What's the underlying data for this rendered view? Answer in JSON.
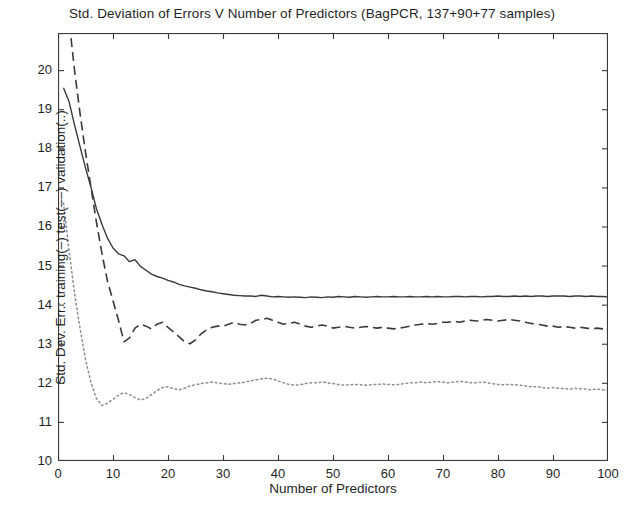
{
  "chart_data": {
    "type": "line",
    "title": "Std. Deviation of Errors V Number of Predictors (BagPCR, 137+90+77 samples)",
    "xlabel": "Number of Predictors",
    "ylabel": "Std. Dev. Err.: training(–) test(––) validation(..)",
    "xlim": [
      0,
      100
    ],
    "ylim": [
      10,
      20.95
    ],
    "xticks": [
      0,
      10,
      20,
      30,
      40,
      50,
      60,
      70,
      80,
      90,
      100
    ],
    "yticks": [
      10,
      11,
      12,
      13,
      14,
      15,
      16,
      17,
      18,
      19,
      20
    ],
    "xtick_labels": [
      "0",
      "10",
      "20",
      "30",
      "40",
      "50",
      "60",
      "70",
      "80",
      "90",
      "100"
    ],
    "ytick_labels": [
      "10",
      "11",
      "12",
      "13",
      "14",
      "15",
      "16",
      "17",
      "18",
      "19",
      "20"
    ],
    "grid": false,
    "legend": "none",
    "box": true,
    "tick_direction": "in",
    "axis_color": "#3a3a3a",
    "x": [
      1,
      2,
      3,
      4,
      5,
      6,
      7,
      8,
      9,
      10,
      11,
      12,
      13,
      14,
      15,
      16,
      17,
      18,
      19,
      20,
      21,
      22,
      23,
      24,
      25,
      26,
      27,
      28,
      29,
      30,
      31,
      32,
      33,
      34,
      35,
      36,
      37,
      38,
      39,
      40,
      41,
      42,
      43,
      44,
      45,
      46,
      47,
      48,
      49,
      50,
      51,
      52,
      53,
      54,
      55,
      56,
      57,
      58,
      59,
      60,
      61,
      62,
      63,
      64,
      65,
      66,
      67,
      68,
      69,
      70,
      71,
      72,
      73,
      74,
      75,
      76,
      77,
      78,
      79,
      80,
      81,
      82,
      83,
      84,
      85,
      86,
      87,
      88,
      89,
      90,
      91,
      92,
      93,
      94,
      95,
      96,
      97,
      98,
      99,
      100
    ],
    "series": [
      {
        "name": "training",
        "style": "solid",
        "color": "#3a3a3a",
        "width": 1.4,
        "values": [
          19.55,
          19.2,
          18.6,
          18.05,
          17.5,
          17.0,
          16.45,
          16.05,
          15.7,
          15.45,
          15.3,
          15.25,
          15.1,
          15.15,
          14.98,
          14.88,
          14.78,
          14.72,
          14.68,
          14.62,
          14.58,
          14.52,
          14.48,
          14.45,
          14.42,
          14.38,
          14.35,
          14.33,
          14.3,
          14.28,
          14.26,
          14.24,
          14.23,
          14.22,
          14.22,
          14.21,
          14.24,
          14.22,
          14.2,
          14.21,
          14.2,
          14.19,
          14.2,
          14.19,
          14.18,
          14.2,
          14.19,
          14.18,
          14.2,
          14.19,
          14.21,
          14.2,
          14.19,
          14.21,
          14.2,
          14.19,
          14.2,
          14.21,
          14.2,
          14.2,
          14.21,
          14.2,
          14.2,
          14.21,
          14.2,
          14.2,
          14.21,
          14.2,
          14.21,
          14.2,
          14.2,
          14.21,
          14.21,
          14.2,
          14.21,
          14.21,
          14.2,
          14.21,
          14.21,
          14.22,
          14.21,
          14.21,
          14.22,
          14.21,
          14.22,
          14.21,
          14.22,
          14.22,
          14.21,
          14.22,
          14.22,
          14.22,
          14.21,
          14.22,
          14.22,
          14.21,
          14.22,
          14.21,
          14.21,
          14.2
        ]
      },
      {
        "name": "test",
        "style": "dashed",
        "color": "#3a3a3a",
        "width": 1.6,
        "values": [
          22.6,
          21.3,
          20.0,
          18.9,
          17.9,
          17.0,
          16.1,
          15.3,
          14.6,
          14.1,
          13.6,
          13.05,
          13.15,
          13.4,
          13.5,
          13.45,
          13.38,
          13.5,
          13.55,
          13.42,
          13.3,
          13.18,
          13.05,
          13.0,
          13.1,
          13.25,
          13.35,
          13.42,
          13.45,
          13.45,
          13.5,
          13.55,
          13.5,
          13.48,
          13.52,
          13.6,
          13.62,
          13.65,
          13.6,
          13.55,
          13.5,
          13.52,
          13.55,
          13.5,
          13.45,
          13.42,
          13.45,
          13.48,
          13.45,
          13.4,
          13.42,
          13.45,
          13.42,
          13.4,
          13.42,
          13.44,
          13.42,
          13.4,
          13.42,
          13.4,
          13.38,
          13.4,
          13.42,
          13.45,
          13.48,
          13.5,
          13.52,
          13.5,
          13.52,
          13.55,
          13.55,
          13.58,
          13.55,
          13.58,
          13.6,
          13.58,
          13.6,
          13.62,
          13.6,
          13.58,
          13.6,
          13.62,
          13.6,
          13.58,
          13.55,
          13.52,
          13.5,
          13.48,
          13.45,
          13.45,
          13.42,
          13.44,
          13.42,
          13.4,
          13.42,
          13.4,
          13.38,
          13.4,
          13.38,
          13.35
        ]
      },
      {
        "name": "validation",
        "style": "dotted",
        "color": "#8c8c8c",
        "width": 1.5,
        "values": [
          16.6,
          15.4,
          14.3,
          13.4,
          12.6,
          12.0,
          11.6,
          11.42,
          11.48,
          11.58,
          11.68,
          11.75,
          11.7,
          11.62,
          11.56,
          11.6,
          11.7,
          11.8,
          11.88,
          11.9,
          11.85,
          11.82,
          11.86,
          11.92,
          11.95,
          11.98,
          12.0,
          12.02,
          12.0,
          11.98,
          11.96,
          11.98,
          12.0,
          12.02,
          12.05,
          12.08,
          12.1,
          12.12,
          12.1,
          12.05,
          12.0,
          11.96,
          11.94,
          11.95,
          11.98,
          12.0,
          12.0,
          12.02,
          12.0,
          11.98,
          11.96,
          11.94,
          11.95,
          11.96,
          11.95,
          11.94,
          11.95,
          11.96,
          11.97,
          11.96,
          11.95,
          11.96,
          11.98,
          12.0,
          12.0,
          12.02,
          12.0,
          12.02,
          12.03,
          12.02,
          12.0,
          12.02,
          12.04,
          12.02,
          12.0,
          12.0,
          12.02,
          12.0,
          11.98,
          11.96,
          11.95,
          11.96,
          11.95,
          11.94,
          11.92,
          11.9,
          11.9,
          11.88,
          11.86,
          11.88,
          11.86,
          11.85,
          11.84,
          11.86,
          11.85,
          11.84,
          11.82,
          11.84,
          11.82,
          11.8
        ]
      }
    ]
  }
}
